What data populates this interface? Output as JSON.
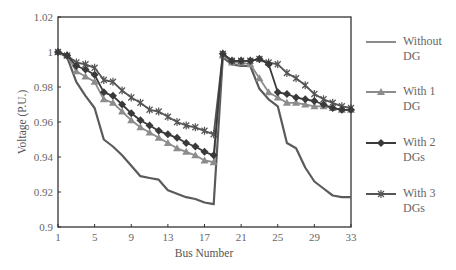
{
  "chart_data": {
    "type": "line",
    "title": "",
    "xlabel": "Bus Number",
    "ylabel": "Voltage (P.U.)",
    "xlim": [
      1,
      33
    ],
    "ylim": [
      0.9,
      1.02
    ],
    "x_ticks": [
      1,
      5,
      9,
      13,
      17,
      21,
      25,
      29,
      33
    ],
    "y_ticks": [
      0.9,
      0.92,
      0.94,
      0.96,
      0.98,
      1,
      1.02
    ],
    "x_tick_labels": [
      "1",
      "5",
      "9",
      "13",
      "17",
      "21",
      "25",
      "29",
      "33"
    ],
    "y_tick_labels": [
      "0.9",
      "0.92",
      "0.94",
      "0.96",
      "0.98",
      "1",
      "1.02"
    ],
    "grid": false,
    "legend_position": "right",
    "x": [
      1,
      2,
      3,
      4,
      5,
      6,
      7,
      8,
      9,
      10,
      11,
      12,
      13,
      14,
      15,
      16,
      17,
      18,
      19,
      20,
      21,
      22,
      23,
      24,
      25,
      26,
      27,
      28,
      29,
      30,
      31,
      32,
      33
    ],
    "series": [
      {
        "name": "Without DG",
        "legend_lines": [
          "Without",
          "DG"
        ],
        "color": "#5a5a5a",
        "legend_color": "#8c8c8c",
        "marker": "none",
        "values": [
          1.0,
          0.997,
          0.983,
          0.975,
          0.968,
          0.95,
          0.946,
          0.941,
          0.935,
          0.929,
          0.928,
          0.927,
          0.921,
          0.919,
          0.917,
          0.916,
          0.914,
          0.913,
          0.997,
          0.993,
          0.992,
          0.992,
          0.979,
          0.973,
          0.969,
          0.948,
          0.945,
          0.934,
          0.926,
          0.922,
          0.918,
          0.917,
          0.917
        ]
      },
      {
        "name": "With 1 DG",
        "legend_lines": [
          "With 1",
          "DG"
        ],
        "color": "#8c8c8c",
        "legend_color": "#8c8c8c",
        "marker": "triangle",
        "values": [
          1.0,
          0.998,
          0.989,
          0.986,
          0.983,
          0.973,
          0.971,
          0.966,
          0.961,
          0.957,
          0.954,
          0.951,
          0.948,
          0.945,
          0.943,
          0.941,
          0.938,
          0.937,
          0.998,
          0.994,
          0.994,
          0.993,
          0.985,
          0.977,
          0.974,
          0.971,
          0.971,
          0.97,
          0.969,
          0.969,
          0.968,
          0.967,
          0.967
        ]
      },
      {
        "name": "With 2 DGs",
        "legend_lines": [
          "With 2",
          "DGs"
        ],
        "color": "#3a3a3a",
        "legend_color": "#3a3a3a",
        "marker": "diamond",
        "values": [
          1.0,
          0.998,
          0.992,
          0.99,
          0.987,
          0.977,
          0.975,
          0.97,
          0.965,
          0.961,
          0.958,
          0.955,
          0.953,
          0.951,
          0.948,
          0.946,
          0.943,
          0.941,
          0.999,
          0.995,
          0.995,
          0.995,
          0.996,
          0.993,
          0.977,
          0.976,
          0.974,
          0.973,
          0.972,
          0.97,
          0.968,
          0.967,
          0.967
        ]
      },
      {
        "name": "With 3 DGs",
        "legend_lines": [
          "With 3",
          "DGs"
        ],
        "color": "#555555",
        "legend_color": "#555555",
        "marker": "star",
        "values": [
          1.0,
          0.998,
          0.994,
          0.993,
          0.991,
          0.984,
          0.983,
          0.978,
          0.974,
          0.971,
          0.967,
          0.966,
          0.963,
          0.96,
          0.958,
          0.957,
          0.955,
          0.953,
          0.999,
          0.995,
          0.995,
          0.995,
          0.996,
          0.994,
          0.993,
          0.988,
          0.985,
          0.981,
          0.976,
          0.973,
          0.971,
          0.969,
          0.968
        ]
      }
    ]
  }
}
